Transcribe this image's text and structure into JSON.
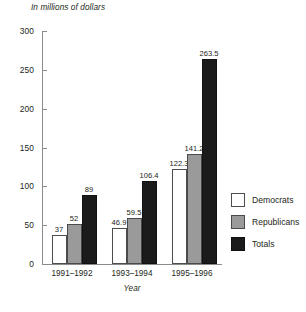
{
  "chart_data": {
    "type": "bar",
    "title": "",
    "subtitle": "",
    "axis_note": "In millions of dollars",
    "xlabel": "Year",
    "ylabel": "",
    "categories": [
      "1991–1992",
      "1993–1994",
      "1995–1996"
    ],
    "series": [
      {
        "name": "Democrats",
        "color": "#ffffff",
        "values": [
          37,
          46.9,
          122.3
        ],
        "labels": [
          "37",
          "46.9",
          "122.3"
        ]
      },
      {
        "name": "Republicans",
        "color": "#9a9a9a",
        "values": [
          52,
          59.5,
          141.2
        ],
        "labels": [
          "52",
          "59.5",
          "141.2"
        ]
      },
      {
        "name": "Totals",
        "color": "#1b1b1b",
        "values": [
          89,
          106.4,
          263.5
        ],
        "labels": [
          "89",
          "106.4",
          "263.5"
        ]
      }
    ],
    "ylim": [
      0,
      300
    ],
    "yticks": [
      0,
      50,
      100,
      150,
      200,
      250,
      300
    ],
    "ytick_labels": [
      "0",
      "50",
      "100",
      "150",
      "200",
      "250",
      "300"
    ],
    "grid": false,
    "legend_position": "right",
    "legend_entries": [
      "Democrats",
      "Republicans",
      "Totals"
    ]
  }
}
